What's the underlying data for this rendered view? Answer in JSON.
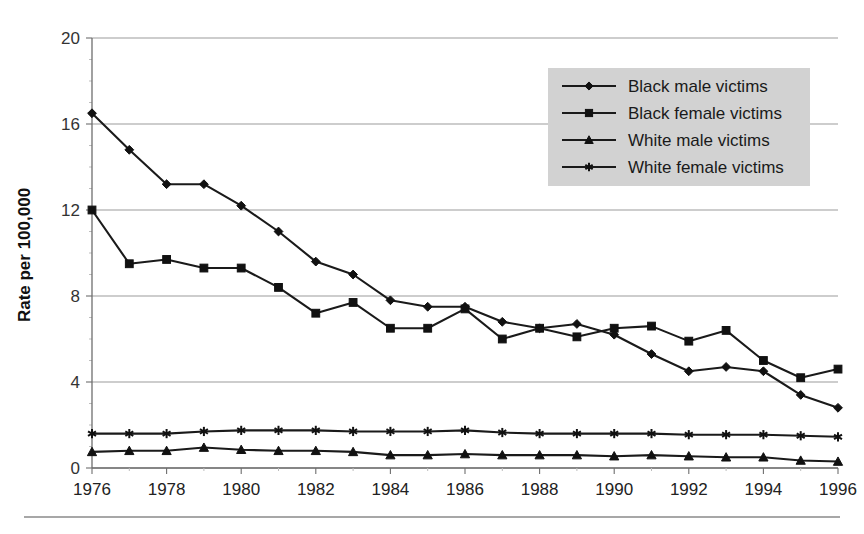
{
  "chart_data": {
    "type": "line",
    "title": "",
    "subtitle": "",
    "xlabel": "",
    "ylabel": "Rate per 100,000",
    "xlim": [
      1976,
      1996
    ],
    "ylim": [
      0,
      20
    ],
    "yticks": [
      "0",
      "4",
      "8",
      "12",
      "16",
      "20"
    ],
    "ytick_values": [
      0,
      4,
      8,
      12,
      16,
      20
    ],
    "xticks": [
      "1976",
      "1978",
      "1980",
      "1982",
      "1984",
      "1986",
      "1988",
      "1990",
      "1992",
      "1994",
      "1996"
    ],
    "xtick_values": [
      1976,
      1978,
      1980,
      1982,
      1984,
      1986,
      1988,
      1990,
      1992,
      1994,
      1996
    ],
    "x": [
      1976,
      1977,
      1978,
      1979,
      1980,
      1981,
      1982,
      1983,
      1984,
      1985,
      1986,
      1987,
      1988,
      1989,
      1990,
      1991,
      1992,
      1993,
      1994,
      1995,
      1996
    ],
    "grid": true,
    "grid_axis": "y",
    "legend_position": "top-right",
    "series": [
      {
        "name": "Black male victims",
        "marker": "diamond",
        "values": [
          16.5,
          14.8,
          13.2,
          13.2,
          12.2,
          11.0,
          9.6,
          9.0,
          7.8,
          7.5,
          7.5,
          6.8,
          6.5,
          6.7,
          6.2,
          5.3,
          4.5,
          4.7,
          4.5,
          3.4,
          2.8
        ]
      },
      {
        "name": "Black female victims",
        "marker": "square",
        "values": [
          12.0,
          9.5,
          9.7,
          9.3,
          9.3,
          8.4,
          7.2,
          7.7,
          6.5,
          6.5,
          7.4,
          6.0,
          6.5,
          6.1,
          6.5,
          6.6,
          5.9,
          6.4,
          5.0,
          4.2,
          4.6
        ]
      },
      {
        "name": "White male victims",
        "marker": "triangle",
        "values": [
          0.75,
          0.8,
          0.8,
          0.95,
          0.85,
          0.8,
          0.8,
          0.75,
          0.6,
          0.6,
          0.65,
          0.6,
          0.6,
          0.6,
          0.55,
          0.6,
          0.55,
          0.5,
          0.5,
          0.35,
          0.3
        ]
      },
      {
        "name": "White female victims",
        "marker": "star",
        "values": [
          1.6,
          1.6,
          1.6,
          1.7,
          1.75,
          1.75,
          1.75,
          1.7,
          1.7,
          1.7,
          1.75,
          1.65,
          1.6,
          1.6,
          1.6,
          1.6,
          1.55,
          1.55,
          1.55,
          1.5,
          1.45
        ]
      }
    ],
    "colors": {
      "line": "#1a1a1a",
      "grid": "#9b9b9b",
      "legend_background": "#d2d2d2",
      "background": "#ffffff"
    }
  },
  "legend": {
    "items": [
      {
        "label": "Black male victims",
        "marker": "diamond"
      },
      {
        "label": "Black female victims",
        "marker": "square"
      },
      {
        "label": "White male victims",
        "marker": "triangle"
      },
      {
        "label": "White female victims",
        "marker": "star"
      }
    ]
  },
  "axes": {
    "y_title": "Rate per 100,000"
  }
}
